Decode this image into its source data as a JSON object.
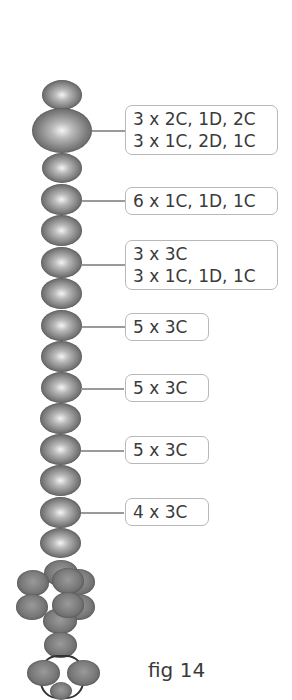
{
  "figure": {
    "caption": "fig 14",
    "labels": [
      {
        "lines": [
          "3 x 2C, 1D, 2C",
          "3 x 1C, 2D, 1C"
        ]
      },
      {
        "lines": [
          "6 x 1C, 1D, 1C"
        ]
      },
      {
        "lines": [
          "3 x 3C",
          "3 x 1C, 1D, 1C"
        ]
      },
      {
        "lines": [
          "5 x 3C"
        ]
      },
      {
        "lines": [
          "5 x 3C"
        ]
      },
      {
        "lines": [
          "5 x 3C"
        ]
      },
      {
        "lines": [
          "4 x 3C"
        ]
      }
    ],
    "colors": {
      "bead_highlight": "#f4f4f4",
      "bead_shadow": "#4a4a4a",
      "label_border": "#b8b8b8",
      "text": "#3a3a3a",
      "connector": "#9a9a9a"
    }
  }
}
